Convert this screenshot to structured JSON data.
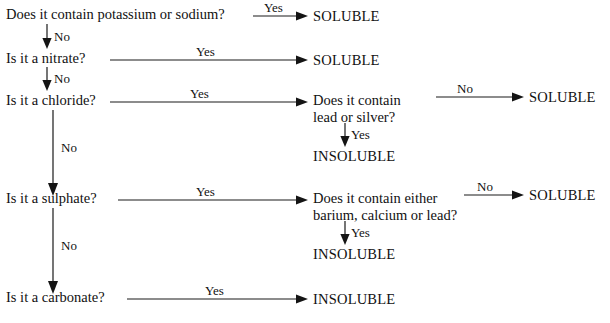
{
  "diagram": {
    "background_color": "#ffffff",
    "line_color": "#1a1a1a",
    "text_color": "#111111"
  },
  "questions": {
    "q1": "Does it contain potassium or sodium?",
    "q2": "Is it a nitrate?",
    "q3": "Is it a chloride?",
    "q4": "Is it a sulphate?",
    "q5": "Is it a carbonate?",
    "q3b_line1": "Does it contain",
    "q3b_line2": "lead or silver?",
    "q4b_line1": "Does it contain either",
    "q4b_line2": "barium, calcium or lead?"
  },
  "outcomes": {
    "soluble": "SOLUBLE",
    "insoluble": "INSOLUBLE",
    "t1": "SOLUBLE",
    "t2": "SOLUBLE",
    "t3": "SOLUBLE",
    "t4": "INSOLUBLE",
    "t5": "SOLUBLE",
    "t6": "INSOLUBLE",
    "t7": "INSOLUBLE"
  },
  "edges": {
    "yes": "Yes",
    "no": "No",
    "e_q1_yes": "Yes",
    "e_q1_no": "No",
    "e_q2_yes": "Yes",
    "e_q2_no": "No",
    "e_q3_yes": "Yes",
    "e_q3_no": "No",
    "e_q3b_no": "No",
    "e_q3b_yes": "Yes",
    "e_q4_yes": "Yes",
    "e_q4_no": "No",
    "e_q4b_no": "No",
    "e_q4b_yes": "Yes",
    "e_q5_yes": "Yes"
  }
}
